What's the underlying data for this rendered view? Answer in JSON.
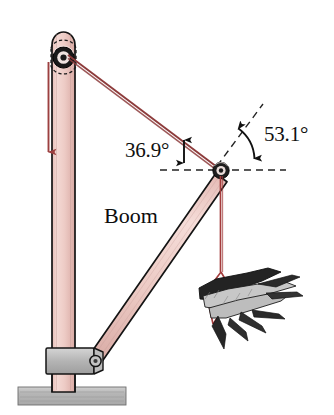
{
  "figure": {
    "labels": {
      "boom": "Boom",
      "angle_cable": "36.9°",
      "angle_boom": "53.1°"
    },
    "colors": {
      "beam_fill": "#f0cfca",
      "beam_stroke": "#1a1a1a",
      "cable": "#8d3b3b",
      "rope": "#a33c3c",
      "ground": "#b5b5b5",
      "bracket": "#b9b9b9",
      "dashed": "#2b2b2b",
      "load_dark": "#222222",
      "load_light": "#c9c9c9",
      "background": "#ffffff"
    },
    "geometry": {
      "mast_top_x": 63,
      "mast_top_y": 30,
      "mast_bottom_y": 392,
      "pulley_top_x": 63,
      "pulley_top_y": 57,
      "boom_pivot_x": 92,
      "boom_pivot_y": 356,
      "boom_tip_x": 221,
      "boom_tip_y": 170,
      "ground_left": 18,
      "ground_right": 126,
      "ground_top": 387,
      "ground_bottom": 405,
      "horizontal_dash_left": 160,
      "horizontal_dash_right": 286,
      "horizontal_dash_y": 170,
      "diagonal_dash_end_x": 263,
      "diagonal_dash_end_y": 104,
      "load_center_x": 232,
      "load_center_y": 300,
      "weight_arrow_x": 48,
      "weight_arrow_top_y": 62,
      "weight_arrow_bottom_y": 160
    },
    "angles": {
      "cable_above_horizontal_deg": 36.9,
      "boom_above_horizontal_deg": 53.1
    },
    "elements": [
      {
        "name": "vertical-mast",
        "type": "beam"
      },
      {
        "name": "boom-beam",
        "type": "beam"
      },
      {
        "name": "guy-cable",
        "type": "line"
      },
      {
        "name": "hoist-rope",
        "type": "line"
      },
      {
        "name": "top-pulley",
        "type": "pulley"
      },
      {
        "name": "boom-tip-pulley",
        "type": "pulley"
      },
      {
        "name": "base-bracket",
        "type": "bracket"
      },
      {
        "name": "ground-slab",
        "type": "ground"
      },
      {
        "name": "log-bundle-load",
        "type": "load"
      }
    ]
  }
}
